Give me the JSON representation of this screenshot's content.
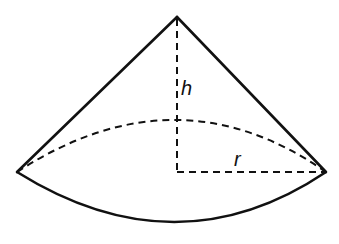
{
  "diagram": {
    "type": "cone-sector-solid",
    "labels": {
      "height": "h",
      "radius": "r"
    },
    "colors": {
      "stroke": "#111111",
      "background": "#ffffff"
    },
    "points": {
      "apex": [
        177,
        17
      ],
      "left_tip": [
        17,
        172
      ],
      "right_tip": [
        326,
        172
      ],
      "center": [
        177,
        172
      ],
      "front_arc_low": [
        177,
        222
      ],
      "back_arc_high": [
        177,
        120
      ]
    }
  }
}
